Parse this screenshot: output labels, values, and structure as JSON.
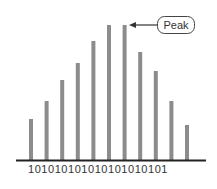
{
  "chart_data": {
    "type": "bar",
    "title": "",
    "xlabel": "",
    "ylabel": "",
    "categories": [
      "1",
      "2",
      "3",
      "4",
      "5",
      "6",
      "7",
      "8",
      "9",
      "10",
      "11"
    ],
    "values": [
      41,
      59,
      80,
      97,
      119,
      135,
      135,
      108,
      89,
      59,
      35
    ],
    "grid": false,
    "annotation": {
      "text": "Peak",
      "target_index": 6
    },
    "axis_label": "101010101010101010101"
  },
  "colors": {
    "bar": "#8c8c8c",
    "baseline": "#222222",
    "text": "#333333",
    "annotation_border": "#444444"
  },
  "annotation": {
    "label": "Peak"
  },
  "axis": {
    "bits": "101010101010101010101"
  }
}
